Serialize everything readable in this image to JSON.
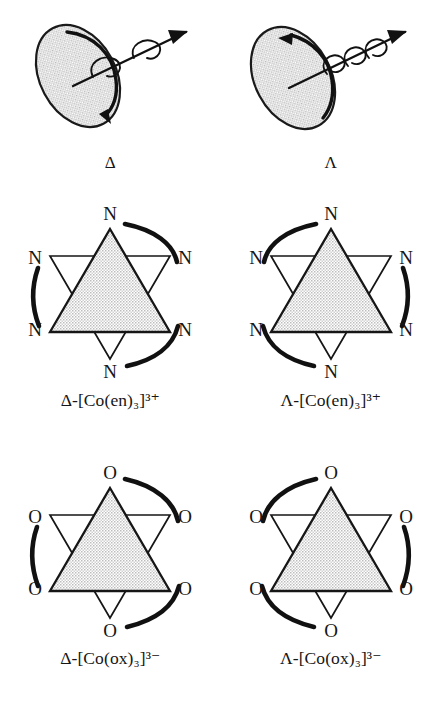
{
  "document": {
    "kind": "chemistry-figure",
    "subject": "Delta and Lambda chirality of octahedral tris-chelate complexes",
    "background_color": "#ffffff",
    "ink_color": "#161616",
    "fill_color": "#dcdcdc"
  },
  "rows": [
    {
      "id": "helix-row",
      "name": "helix-analogy-row",
      "cells": [
        {
          "id": "delta-helix",
          "handedness": "delta",
          "icon": "right-handed-helix-disc-icon",
          "caption": "Δ",
          "helix_turns": 2,
          "helix_style": "loose",
          "disc_arrow_direction": "clockwise",
          "disc_arrowhead_position": "lower-right"
        },
        {
          "id": "lambda-helix",
          "handedness": "lambda",
          "icon": "left-handed-helix-disc-icon",
          "caption": "Λ",
          "helix_turns": 3,
          "helix_style": "tight",
          "disc_arrow_direction": "counterclockwise",
          "disc_arrowhead_position": "upper-left"
        }
      ]
    },
    {
      "id": "en-row",
      "name": "tris-ethylenediamine-row",
      "donor_atom": "N",
      "vertex_labels": [
        "N",
        "N",
        "N",
        "N",
        "N",
        "N"
      ],
      "cells": [
        {
          "id": "delta-co-en",
          "handedness": "delta",
          "icon": "hexagram-delta-icon",
          "caption": "Δ-[Co(en)₃]³⁺",
          "caption_parts": {
            "greek": "Δ",
            "dash": "-",
            "bracket_open": "[",
            "metal": "Co",
            "ligand": "(en)",
            "ligand_count": "3",
            "bracket_close": "]",
            "charge": "3+"
          },
          "chelate_arc_count": 3,
          "chelate_arc_sense": "clockwise"
        },
        {
          "id": "lambda-co-en",
          "handedness": "lambda",
          "icon": "hexagram-lambda-icon",
          "caption": "Λ-[Co(en)₃]³⁺",
          "caption_parts": {
            "greek": "Λ",
            "dash": "-",
            "bracket_open": "[",
            "metal": "Co",
            "ligand": "(en)",
            "ligand_count": "3",
            "bracket_close": "]",
            "charge": "3+"
          },
          "chelate_arc_count": 3,
          "chelate_arc_sense": "counterclockwise"
        }
      ]
    },
    {
      "id": "ox-row",
      "name": "tris-oxalato-row",
      "donor_atom": "O",
      "vertex_labels": [
        "O",
        "O",
        "O",
        "O",
        "O",
        "O"
      ],
      "cells": [
        {
          "id": "delta-co-ox",
          "handedness": "delta",
          "icon": "hexagram-delta-icon",
          "caption": "Δ-[Co(ox)₃]³⁻",
          "caption_parts": {
            "greek": "Δ",
            "dash": "-",
            "bracket_open": "[",
            "metal": "Co",
            "ligand": "(ox)",
            "ligand_count": "3",
            "bracket_close": "]",
            "charge": "3−"
          },
          "chelate_arc_count": 3,
          "chelate_arc_sense": "clockwise"
        },
        {
          "id": "lambda-co-ox",
          "handedness": "lambda",
          "icon": "hexagram-lambda-icon",
          "caption": "Λ-[Co(ox)₃]³⁻",
          "caption_parts": {
            "greek": "Λ",
            "dash": "-",
            "bracket_open": "[",
            "metal": "Co",
            "ligand": "(ox)",
            "ligand_count": "3",
            "bracket_close": "]",
            "charge": "3−"
          },
          "chelate_arc_count": 3,
          "chelate_arc_sense": "counterclockwise"
        }
      ]
    }
  ]
}
